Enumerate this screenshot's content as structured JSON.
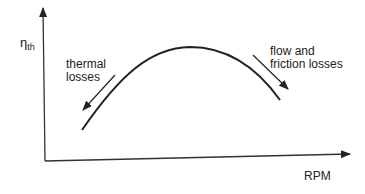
{
  "diagram": {
    "y_axis": {
      "symbol": "η",
      "subscript": "th"
    },
    "x_axis": {
      "label": "RPM"
    },
    "annotations": {
      "left": {
        "line1": "thermal",
        "line2": "losses"
      },
      "right": {
        "line1": "flow and",
        "line2": "friction losses"
      }
    },
    "colors": {
      "stroke": "#222222",
      "background": "#ffffff"
    }
  }
}
